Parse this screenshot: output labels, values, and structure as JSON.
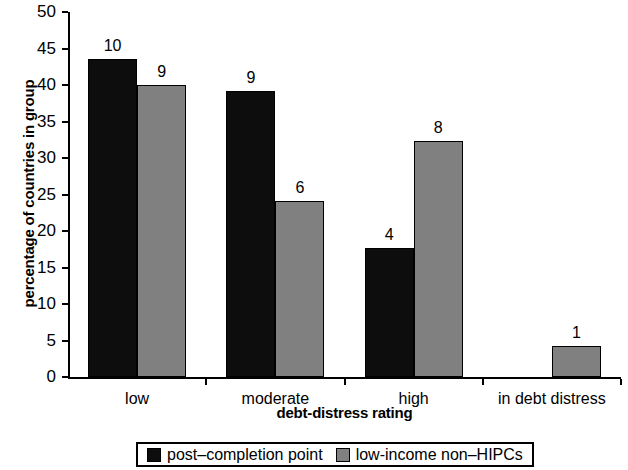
{
  "chart_data": {
    "type": "bar",
    "title": "",
    "subtitle": "",
    "xlabel": "debt-distress rating",
    "ylabel": "percentage of countries in group",
    "categories": [
      "low",
      "moderate",
      "high",
      "in debt distress"
    ],
    "ylim": [
      0,
      50
    ],
    "ytick_step": 5,
    "yticks": [
      "50",
      "45",
      "40",
      "35",
      "30",
      "25",
      "20",
      "15",
      "10",
      "5",
      "0"
    ],
    "grid": false,
    "legend_position": "bottom-outside",
    "series": [
      {
        "name": "post–completion point",
        "color": "#0d0d0d",
        "values": [
          43.6,
          39.2,
          17.7,
          0
        ],
        "data_labels": [
          "10",
          "9",
          "4",
          ""
        ]
      },
      {
        "name": "low-income non–HIPCs",
        "color": "#808080",
        "values": [
          40.0,
          24.1,
          32.3,
          4.3
        ],
        "data_labels": [
          "9",
          "6",
          "8",
          "1"
        ]
      }
    ]
  },
  "axes": {
    "y_title": "percentage of countries in group",
    "x_title": "debt-distress rating"
  },
  "legend": {
    "entries": [
      {
        "label": "post–completion point",
        "color": "#0d0d0d"
      },
      {
        "label": "low-income non–HIPCs",
        "color": "#808080"
      }
    ]
  }
}
